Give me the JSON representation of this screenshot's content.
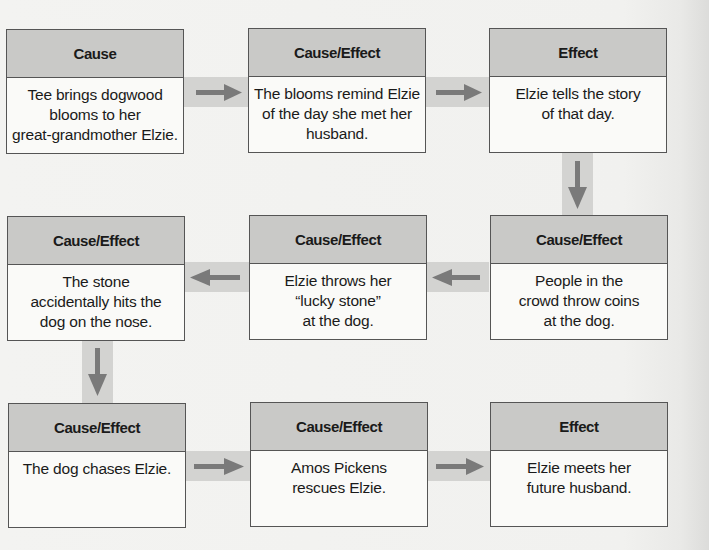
{
  "colors": {
    "background": "#f2f2f0",
    "header_fill": "#c9c9c7",
    "box_fill": "#fafaf8",
    "border": "#555555",
    "connector_band": "#d3d3d1",
    "arrow": "#7a7a7a"
  },
  "boxes": [
    {
      "row": 1,
      "col": 1,
      "label": "Cause",
      "text": "Tee brings dogwood\nblooms to her\ngreat-grandmother Elzie."
    },
    {
      "row": 1,
      "col": 2,
      "label": "Cause/Effect",
      "text": "The blooms remind Elzie\nof the day she met her\nhusband."
    },
    {
      "row": 1,
      "col": 3,
      "label": "Effect",
      "text": "Elzie tells the story\nof that day."
    },
    {
      "row": 2,
      "col": 3,
      "label": "Cause/Effect",
      "text": "People in the\ncrowd throw coins\nat the dog."
    },
    {
      "row": 2,
      "col": 2,
      "label": "Cause/Effect",
      "text": "Elzie throws her\n“lucky stone”\nat the dog."
    },
    {
      "row": 2,
      "col": 1,
      "label": "Cause/Effect",
      "text": "The stone\naccidentally hits the\ndog on the nose."
    },
    {
      "row": 3,
      "col": 1,
      "label": "Cause/Effect",
      "text": "The dog chases Elzie."
    },
    {
      "row": 3,
      "col": 2,
      "label": "Cause/Effect",
      "text": "Amos Pickens\nrescues Elzie."
    },
    {
      "row": 3,
      "col": 3,
      "label": "Effect",
      "text": "Elzie meets her\nfuture husband."
    }
  ],
  "connectors": [
    {
      "from": 0,
      "to": 1,
      "direction": "right"
    },
    {
      "from": 1,
      "to": 2,
      "direction": "right"
    },
    {
      "from": 2,
      "to": 3,
      "direction": "down"
    },
    {
      "from": 3,
      "to": 4,
      "direction": "left"
    },
    {
      "from": 4,
      "to": 5,
      "direction": "left"
    },
    {
      "from": 5,
      "to": 6,
      "direction": "down"
    },
    {
      "from": 6,
      "to": 7,
      "direction": "right"
    },
    {
      "from": 7,
      "to": 8,
      "direction": "right"
    }
  ]
}
